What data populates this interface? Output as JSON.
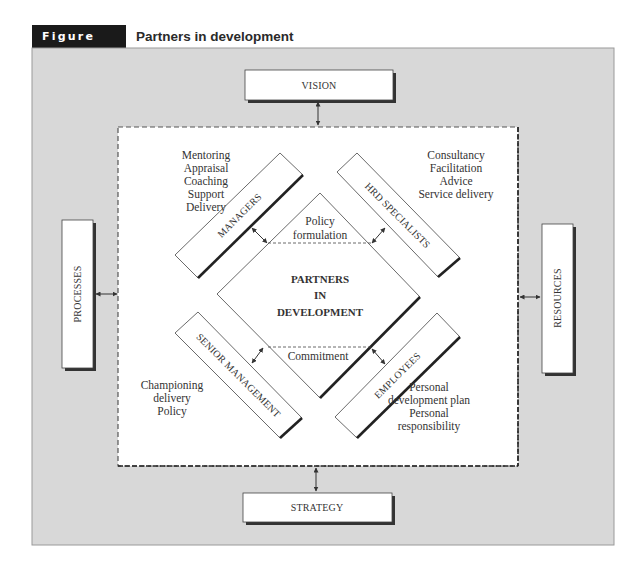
{
  "figure": {
    "number": "Figure 7.4",
    "title": "Partners in development"
  },
  "outer_boxes": {
    "top": "VISION",
    "bottom": "STRATEGY",
    "left": "PROCESSES",
    "right": "RESOURCES"
  },
  "partners": {
    "managers": {
      "label": "MANAGERS",
      "roles": [
        "Mentoring",
        "Appraisal",
        "Coaching",
        "Support",
        "Delivery"
      ]
    },
    "hrd_specialists": {
      "label": "HRD SPECIALISTS",
      "roles": [
        "Consultancy",
        "Facilitation",
        "Advice",
        "Service delivery"
      ]
    },
    "senior_management": {
      "label": "SENIOR MANAGEMENT",
      "roles": [
        "Championing",
        "delivery",
        "Policy"
      ]
    },
    "employees": {
      "label": "EMPLOYEES",
      "roles": [
        "Personal",
        "development plan",
        "Personal",
        "responsibility"
      ]
    }
  },
  "center": {
    "lines": [
      "PARTNERS",
      "IN",
      "DEVELOPMENT"
    ],
    "top_zone": [
      "Policy",
      "formulation"
    ],
    "bottom_zone": "Commitment"
  },
  "colors": {
    "panel": "#d8d8d8",
    "title_bg": "#1a1a1a",
    "line": "#333333"
  }
}
